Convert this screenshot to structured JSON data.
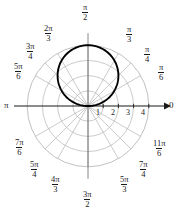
{
  "figure": {
    "title": "",
    "type": "polar-plot",
    "origin_label": "0",
    "pi_label": "π"
  },
  "chart_data": {
    "type": "line",
    "coordinate_system": "polar",
    "title": "",
    "xlabel": "",
    "ylabel": "",
    "equation": "r = 4 sin(θ)",
    "r_range": [
      0,
      4
    ],
    "theta_range_deg": [
      0,
      360
    ],
    "radial_ticks": [
      "1",
      "2",
      "3",
      "4"
    ],
    "radial_tick_values": [
      1,
      2,
      3,
      4
    ],
    "grid": true,
    "legend": false,
    "angle_labels": [
      {
        "text_num": "",
        "text_den": "",
        "plain": "0",
        "deg": 0,
        "radians": "0"
      },
      {
        "text_num": "π",
        "text_den": "6",
        "plain": "",
        "deg": 30,
        "radians": "pi/6"
      },
      {
        "text_num": "π",
        "text_den": "4",
        "plain": "",
        "deg": 45,
        "radians": "pi/4"
      },
      {
        "text_num": "π",
        "text_den": "3",
        "plain": "",
        "deg": 60,
        "radians": "pi/3"
      },
      {
        "text_num": "π",
        "text_den": "2",
        "plain": "",
        "deg": 90,
        "radians": "pi/2"
      },
      {
        "text_num": "2π",
        "text_den": "3",
        "plain": "",
        "deg": 120,
        "radians": "2pi/3"
      },
      {
        "text_num": "3π",
        "text_den": "4",
        "plain": "",
        "deg": 135,
        "radians": "3pi/4"
      },
      {
        "text_num": "5π",
        "text_den": "6",
        "plain": "",
        "deg": 150,
        "radians": "5pi/6"
      },
      {
        "text_num": "",
        "text_den": "",
        "plain": "π",
        "deg": 180,
        "radians": "pi"
      },
      {
        "text_num": "7π",
        "text_den": "6",
        "plain": "",
        "deg": 210,
        "radians": "7pi/6"
      },
      {
        "text_num": "5π",
        "text_den": "4",
        "plain": "",
        "deg": 225,
        "radians": "5pi/4"
      },
      {
        "text_num": "4π",
        "text_den": "3",
        "plain": "",
        "deg": 240,
        "radians": "4pi/3"
      },
      {
        "text_num": "3π",
        "text_den": "2",
        "plain": "",
        "deg": 270,
        "radians": "3pi/2"
      },
      {
        "text_num": "5π",
        "text_den": "3",
        "plain": "",
        "deg": 300,
        "radians": "5pi/3"
      },
      {
        "text_num": "7π",
        "text_den": "4",
        "plain": "",
        "deg": 315,
        "radians": "7pi/4"
      },
      {
        "text_num": "11π",
        "text_den": "6",
        "plain": "",
        "deg": 330,
        "radians": "11pi/6"
      }
    ],
    "curve_color": "#000000",
    "grid_color": "#b5b5b5",
    "axis_color": "#1a1a1a",
    "background": "#ffffff"
  }
}
